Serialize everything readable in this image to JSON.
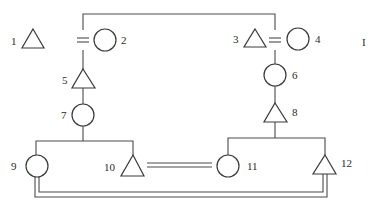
{
  "diagram": {
    "type": "pedigree",
    "generation_marker": "I",
    "individuals": [
      {
        "id": "1",
        "label": "1",
        "shape": "triangle"
      },
      {
        "id": "2",
        "label": "2",
        "shape": "circle"
      },
      {
        "id": "3",
        "label": "3",
        "shape": "triangle"
      },
      {
        "id": "4",
        "label": "4",
        "shape": "circle"
      },
      {
        "id": "5",
        "label": "5",
        "shape": "triangle"
      },
      {
        "id": "6",
        "label": "6",
        "shape": "circle"
      },
      {
        "id": "7",
        "label": "7",
        "shape": "circle"
      },
      {
        "id": "8",
        "label": "8",
        "shape": "triangle"
      },
      {
        "id": "9",
        "label": "9",
        "shape": "circle"
      },
      {
        "id": "10",
        "label": "10",
        "shape": "triangle"
      },
      {
        "id": "11",
        "label": "11",
        "shape": "circle"
      },
      {
        "id": "12",
        "label": "12",
        "shape": "triangle"
      }
    ],
    "unions": [
      {
        "partners": [
          "1",
          "2"
        ],
        "style": "double"
      },
      {
        "partners": [
          "3",
          "4"
        ],
        "style": "double"
      },
      {
        "partners": [
          "10",
          "11"
        ],
        "style": "double"
      },
      {
        "partners": [
          "9",
          "12"
        ],
        "style": "double"
      }
    ],
    "links": [
      {
        "from": "1=2",
        "to": "3=4",
        "style": "single",
        "note": "top connector line"
      },
      {
        "from": "1=2",
        "to": "5"
      },
      {
        "from": "3=4",
        "to": "6"
      },
      {
        "from": "5",
        "to": "7"
      },
      {
        "from": "6",
        "to": "8"
      },
      {
        "from": "7",
        "to": [
          "9",
          "10"
        ],
        "note": "sibship"
      },
      {
        "from": "8",
        "to": [
          "11",
          "12"
        ],
        "note": "sibship"
      }
    ]
  }
}
